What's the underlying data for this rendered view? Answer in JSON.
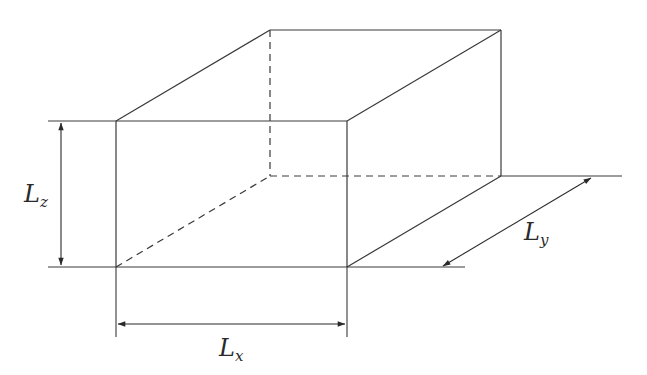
{
  "diagram": {
    "type": "box-dimensions",
    "stroke_color": "#3a3a3a",
    "background": "#ffffff",
    "labels": {
      "lx": {
        "main": "L",
        "sub": "x"
      },
      "ly": {
        "main": "L",
        "sub": "y"
      },
      "lz": {
        "main": "L",
        "sub": "z"
      }
    },
    "vertices": {
      "front_top_left": [
        116,
        121
      ],
      "front_top_right": [
        347,
        121
      ],
      "front_bottom_left": [
        116,
        267
      ],
      "front_bottom_right": [
        347,
        267
      ],
      "back_top_left": [
        270,
        30
      ],
      "back_top_right": [
        501,
        30
      ],
      "back_bottom_left": [
        270,
        176
      ],
      "back_bottom_right": [
        501,
        176
      ]
    }
  }
}
